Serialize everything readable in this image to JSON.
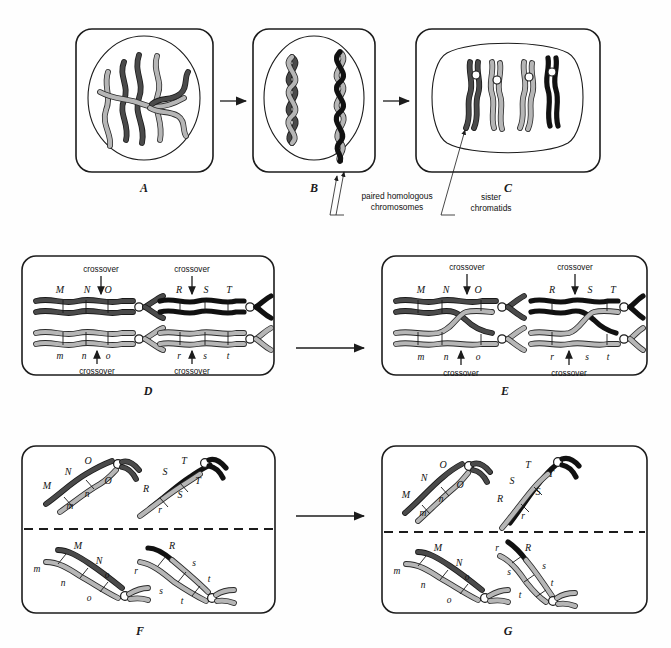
{
  "figure": {
    "background": "#fefefe",
    "ink": "#1a1a1a"
  },
  "colors": {
    "chromosome_dark": "#4a4a4a",
    "chromosome_light": "#b6b6b6",
    "chromosome_black": "#111111",
    "outline": "#1a1a1a",
    "centromere": "#ffffff"
  },
  "panels": [
    {
      "id": "A",
      "label": "A",
      "stage": "interphase-leptotene",
      "description": "Nucleus with unpaired thread-like chromosomes"
    },
    {
      "id": "B",
      "label": "B",
      "stage": "zygotene-synapsis",
      "description": "Homologous chromosomes paired and intertwined"
    },
    {
      "id": "C",
      "label": "C",
      "stage": "pachytene",
      "description": "Each paired chromosome shows two sister chromatids"
    },
    {
      "id": "D",
      "label": "D",
      "stage": "pre-crossover",
      "description": "Bivalents with gene loci shown before crossing over"
    },
    {
      "id": "E",
      "label": "E",
      "stage": "crossover",
      "description": "Chiasmata form, inner chromatids exchange segments"
    },
    {
      "id": "F",
      "label": "F",
      "stage": "anaphase-i",
      "description": "Recombinant chromosomes separating to opposite poles"
    },
    {
      "id": "G",
      "label": "G",
      "stage": "telophase-i",
      "description": "Recombinant chromosomes at opposite poles"
    }
  ],
  "callouts": [
    {
      "id": "paired-homologous",
      "line1": "paired homologous",
      "line2": "chromosomes",
      "points_to": "B"
    },
    {
      "id": "sister-chromatids",
      "line1": "sister",
      "line2": "chromatids",
      "points_to": "C"
    }
  ],
  "crossover_labels": {
    "top": "crossover",
    "bottom": "crossover"
  },
  "gene_loci": {
    "panel_d": {
      "pair1_upper": [
        "M",
        "N",
        "O"
      ],
      "pair1_lower": [
        "m",
        "n",
        "o"
      ],
      "pair2_upper": [
        "R",
        "S",
        "T"
      ],
      "pair2_lower": [
        "r",
        "s",
        "t"
      ]
    },
    "panel_e": {
      "pair1_upper": [
        "M",
        "N",
        "O"
      ],
      "pair1_lower": [
        "m",
        "n",
        "o"
      ],
      "pair2_upper": [
        "R",
        "S",
        "T"
      ],
      "pair2_lower": [
        "r",
        "s",
        "t"
      ]
    },
    "panel_f": {
      "top_left": [
        "M",
        "N",
        "O",
        "O",
        "n",
        "m"
      ],
      "top_right": [
        "R",
        "S",
        "T",
        "T",
        "S",
        "r"
      ],
      "bottom_left": [
        "M",
        "N",
        "m",
        "n",
        "o",
        "o"
      ],
      "bottom_right": [
        "R",
        "r",
        "s",
        "s",
        "t",
        "t"
      ]
    },
    "panel_g": {
      "top_left": [
        "M",
        "N",
        "O",
        "O",
        "n",
        "m"
      ],
      "top_right": [
        "R",
        "S",
        "T",
        "T",
        "S",
        "r"
      ],
      "bottom_left": [
        "M",
        "N",
        "m",
        "n",
        "o",
        "o"
      ],
      "bottom_right": [
        "R",
        "r",
        "s",
        "s",
        "t",
        "t"
      ]
    }
  },
  "arrows": [
    {
      "id": "arrow-a-b",
      "from": "A",
      "to": "B"
    },
    {
      "id": "arrow-b-c",
      "from": "B",
      "to": "C"
    },
    {
      "id": "arrow-d-e",
      "from": "D",
      "to": "E"
    },
    {
      "id": "arrow-f-g",
      "from": "F",
      "to": "G"
    }
  ]
}
